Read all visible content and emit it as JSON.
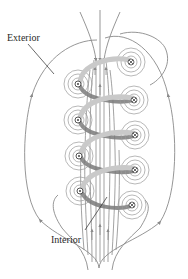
{
  "diagram": {
    "labels": {
      "exterior": "Exterior",
      "interior": "Interior"
    },
    "colors": {
      "field_line": "#8a8a8a",
      "coil_light": "#c9c9c9",
      "coil_dark": "#7a7a7a",
      "wire_symbol": "#444444",
      "text": "#2a2a2a",
      "background": "#ffffff"
    },
    "wires_out_of_page": [
      {
        "x": 78,
        "y": 84
      },
      {
        "x": 78,
        "y": 120
      },
      {
        "x": 79,
        "y": 156
      },
      {
        "x": 80,
        "y": 191
      }
    ],
    "wires_into_page": [
      {
        "x": 131,
        "y": 62
      },
      {
        "x": 134,
        "y": 100
      },
      {
        "x": 135,
        "y": 135
      },
      {
        "x": 135,
        "y": 170
      },
      {
        "x": 132,
        "y": 205
      }
    ],
    "turns": 4
  }
}
